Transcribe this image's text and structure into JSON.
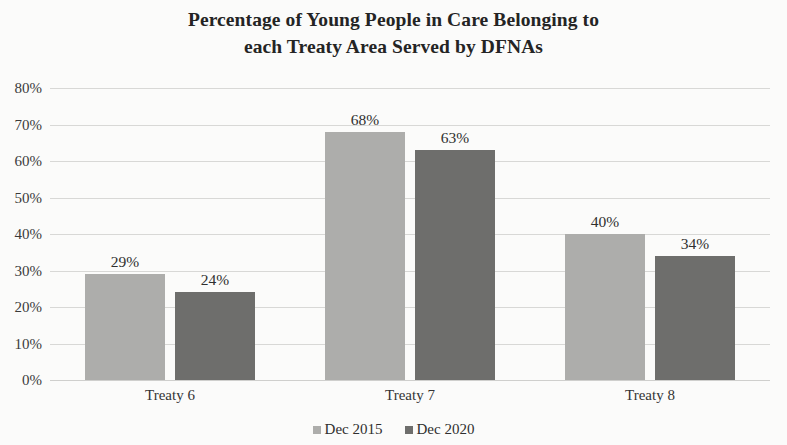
{
  "chart_data": {
    "type": "bar",
    "title": "Percentage of Young People in Care Belonging to each Treaty Area Served by DFNAs",
    "title_line1": "Percentage of Young People in Care Belonging to",
    "title_line2": "each Treaty Area Served by DFNAs",
    "xlabel": "",
    "ylabel": "",
    "categories": [
      "Treaty 6",
      "Treaty 7",
      "Treaty 8"
    ],
    "series": [
      {
        "name": "Dec 2015",
        "color": "#adadab",
        "values": [
          29,
          68,
          40
        ],
        "labels": [
          "29%",
          "68%",
          "40%"
        ]
      },
      {
        "name": "Dec 2020",
        "color": "#6e6e6c",
        "values": [
          24,
          63,
          34
        ],
        "labels": [
          "24%",
          "63%",
          "34%"
        ]
      }
    ],
    "ylim": [
      0,
      80
    ],
    "ytick_values": [
      80,
      70,
      60,
      50,
      40,
      30,
      20,
      10,
      0
    ],
    "ytick_labels": [
      "80%",
      "70%",
      "60%",
      "50%",
      "40%",
      "30%",
      "20%",
      "10%",
      "0%"
    ],
    "grid": true,
    "grid_axis": "y",
    "legend_position": "bottom",
    "value_labels": true
  }
}
